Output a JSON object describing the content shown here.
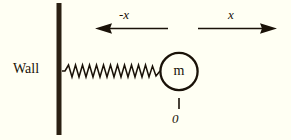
{
  "figure": {
    "background_color": "#fffff3",
    "ink_color": "#1a1208",
    "width": 291,
    "height": 140
  },
  "labels": {
    "wall": "Wall",
    "mass": "m",
    "negative_direction": "-x",
    "positive_direction": "x",
    "origin": "0"
  },
  "elements": {
    "wall_bar": {
      "name": "wall-bar",
      "x": 58,
      "y_top": 3,
      "y_bottom": 135,
      "thickness": 5
    },
    "spring": {
      "name": "spring-coil",
      "x_start": 63,
      "x_end": 160,
      "y": 71,
      "coils": 14,
      "amplitude": 6
    },
    "mass_circle": {
      "name": "mass-circle",
      "cx": 179,
      "cy": 71,
      "r": 19,
      "stroke_width": 2.2
    },
    "origin_tick": {
      "name": "origin-tick",
      "x": 179,
      "y_top": 98,
      "y_bottom": 109
    },
    "left_arrow": {
      "name": "negative-x-arrow",
      "y": 28,
      "x_tail": 168,
      "x_tip": 95,
      "direction": "left"
    },
    "right_arrow": {
      "name": "positive-x-arrow",
      "y": 28,
      "x_tail": 198,
      "x_tip": 277,
      "direction": "right"
    }
  }
}
